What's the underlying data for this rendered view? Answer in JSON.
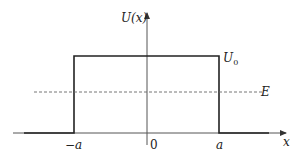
{
  "diagram": {
    "type": "potential-barrier",
    "labels": {
      "y_axis": "U(x)",
      "x_axis": "x",
      "barrier_height": "U",
      "barrier_height_sub": "0",
      "energy": "E",
      "left_edge": "−a",
      "origin": "0",
      "right_edge": "a"
    },
    "colors": {
      "line": "#222222",
      "axis": "#555555",
      "dashed": "#666666"
    }
  }
}
